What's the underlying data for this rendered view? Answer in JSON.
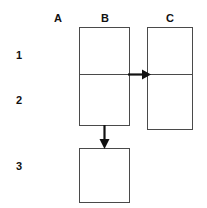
{
  "diagram": {
    "background_color": "#ffffff",
    "line_color": "#4a4a4a",
    "text_color": "#111111",
    "column_headers": [
      {
        "label": "A",
        "x": 48,
        "y": 12
      },
      {
        "label": "B",
        "x": 95,
        "y": 12
      },
      {
        "label": "C",
        "x": 160,
        "y": 12
      }
    ],
    "row_labels": [
      {
        "label": "1",
        "x": 12,
        "y": 49
      },
      {
        "label": "2",
        "x": 12,
        "y": 94
      },
      {
        "label": "3",
        "x": 12,
        "y": 160
      }
    ],
    "boxes": [
      {
        "name": "box-b-rows-1-2",
        "column": "B",
        "rows": "1-2",
        "x": 79,
        "y": 27,
        "width": 51,
        "height": 99,
        "divider_offset": 47
      },
      {
        "name": "box-c-rows-1-2",
        "column": "C",
        "rows": "1-2",
        "x": 147,
        "y": 27,
        "width": 46,
        "height": 103,
        "divider_offset": 47
      },
      {
        "name": "box-b-row-3",
        "column": "B",
        "rows": "3",
        "x": 79,
        "y": 148,
        "width": 51,
        "height": 55,
        "divider_offset": null
      }
    ],
    "arrows": [
      {
        "name": "arrow-b-to-c",
        "direction": "right",
        "from": "box-b-rows-1-2",
        "to": "box-c-rows-1-2",
        "x1": 130,
        "y1": 74,
        "x2": 150,
        "y2": 74
      },
      {
        "name": "arrow-b-to-b3",
        "direction": "down",
        "from": "box-b-rows-1-2",
        "to": "box-b-row-3",
        "x1": 104,
        "y1": 126,
        "x2": 104,
        "y2": 150
      }
    ]
  }
}
